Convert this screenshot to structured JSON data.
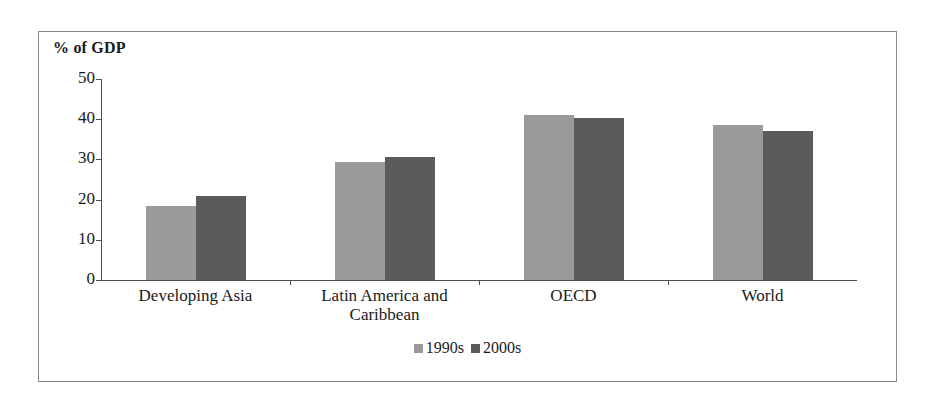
{
  "chart_data": {
    "type": "bar",
    "title": "",
    "ylabel": "% of GDP",
    "xlabel": "",
    "ylim": [
      0,
      50
    ],
    "yticks": [
      0,
      10,
      20,
      30,
      40,
      50
    ],
    "ytick_labels": [
      "0",
      "10",
      "20",
      "30",
      "40",
      "50"
    ],
    "grid": false,
    "legend_position": "bottom-center",
    "categories": [
      "Developing Asia",
      "Latin America and\nCaribbean",
      "OECD",
      "World"
    ],
    "series": [
      {
        "name": "1990s",
        "color": "#9a9a9a",
        "values": [
          18.5,
          29.4,
          41.0,
          38.5
        ]
      },
      {
        "name": "2000s",
        "color": "#5b5b5b",
        "values": [
          21.0,
          30.5,
          40.3,
          37.1
        ]
      }
    ]
  },
  "axis": {
    "unit_title": "% of GDP"
  }
}
